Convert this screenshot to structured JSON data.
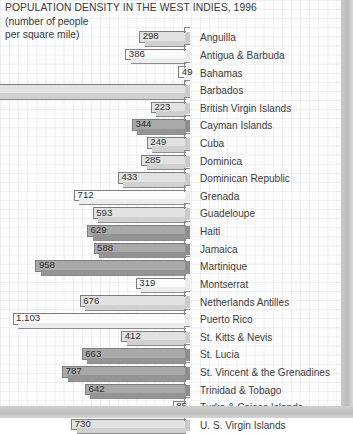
{
  "title": {
    "main": "POPULATION DENSITY IN THE WEST INDIES, 1996",
    "sub_line_1": "(number of people",
    "sub_line_2": "per square mile)"
  },
  "colors": {
    "bar_light": "#e2e2e2",
    "bar_dark": "#a9a9a9",
    "bar_white": "#fbfbfb",
    "outline": "#7e7e7e",
    "text": "#3b3b3b",
    "page_edge": "#c4c4c4"
  },
  "chart_data": {
    "type": "bar",
    "orientation": "horizontal",
    "title": "POPULATION DENSITY IN THE WEST INDIES, 1996",
    "subtitle": "(number of people per square mile)",
    "xlabel": "number of people per square mile",
    "ylabel": "",
    "grid": true,
    "legend": "none",
    "note": "Bars are drawn right-aligned (growing leftward) with a 3-D extrusion; the Barbados bar extends beyond the left page edge so its value label is clipped off-image.",
    "xlim": [
      0,
      1600
    ],
    "categories": [
      "Anguilla",
      "Antigua & Barbuda",
      "Bahamas",
      "Barbados",
      "British Virgin Islands",
      "Cayman Islands",
      "Cuba",
      "Dominica",
      "Dominican Republic",
      "Grenada",
      "Guadeloupe",
      "Haiti",
      "Jamaica",
      "Martinique",
      "Montserrat",
      "Netherlands Antilles",
      "Puerto Rico",
      "St. Kitts & Nevis",
      "St. Lucia",
      "St. Vincent & the Grenadines",
      "Trinidad & Tobago",
      "Turks & Caicos Islands",
      "U. S. Virgin Islands"
    ],
    "values": [
      298,
      386,
      49,
      null,
      223,
      344,
      249,
      285,
      433,
      712,
      593,
      629,
      588,
      958,
      319,
      676,
      1103,
      412,
      663,
      787,
      642,
      85,
      730
    ],
    "value_labels": [
      "298",
      "386",
      "49",
      "",
      "223",
      "344",
      "249",
      "285",
      "433",
      "712",
      "593",
      "629",
      "588",
      "958",
      "319",
      "676",
      "1,103",
      "412",
      "663",
      "787",
      "642",
      "85",
      "730"
    ]
  },
  "rows": [
    {
      "label": "Anguilla",
      "value": "298",
      "v": 298,
      "shade": "light"
    },
    {
      "label": "Antigua & Barbuda",
      "value": "386",
      "v": 386,
      "shade": "white"
    },
    {
      "label": "Bahamas",
      "value": "49",
      "v": 49,
      "shade": "white"
    },
    {
      "label": "Barbados",
      "value": "",
      "v": 1600,
      "shade": "light"
    },
    {
      "label": "British Virgin Islands",
      "value": "223",
      "v": 223,
      "shade": "light"
    },
    {
      "label": "Cayman Islands",
      "value": "344",
      "v": 344,
      "shade": "dark"
    },
    {
      "label": "Cuba",
      "value": "249",
      "v": 249,
      "shade": "light"
    },
    {
      "label": "Dominica",
      "value": "285",
      "v": 285,
      "shade": "light"
    },
    {
      "label": "Dominican Republic",
      "value": "433",
      "v": 433,
      "shade": "light"
    },
    {
      "label": "Grenada",
      "value": "712",
      "v": 712,
      "shade": "white"
    },
    {
      "label": "Guadeloupe",
      "value": "593",
      "v": 593,
      "shade": "light"
    },
    {
      "label": "Haiti",
      "value": "629",
      "v": 629,
      "shade": "dark"
    },
    {
      "label": "Jamaica",
      "value": "588",
      "v": 588,
      "shade": "dark"
    },
    {
      "label": "Martinique",
      "value": "958",
      "v": 958,
      "shade": "dark"
    },
    {
      "label": "Montserrat",
      "value": "319",
      "v": 319,
      "shade": "white"
    },
    {
      "label": "Netherlands Antilles",
      "value": "676",
      "v": 676,
      "shade": "light"
    },
    {
      "label": "Puerto Rico",
      "value": "1,103",
      "v": 1103,
      "shade": "white"
    },
    {
      "label": "St. Kitts & Nevis",
      "value": "412",
      "v": 412,
      "shade": "light"
    },
    {
      "label": "St. Lucia",
      "value": "663",
      "v": 663,
      "shade": "dark"
    },
    {
      "label": "St. Vincent & the Grenadines",
      "value": "787",
      "v": 787,
      "shade": "dark"
    },
    {
      "label": "Trinidad & Tobago",
      "value": "642",
      "v": 642,
      "shade": "dark"
    },
    {
      "label": "Turks & Caicos Islands",
      "value": "85",
      "v": 85,
      "shade": "white"
    },
    {
      "label": "U. S. Virgin Islands",
      "value": "730",
      "v": 730,
      "shade": "light"
    }
  ]
}
